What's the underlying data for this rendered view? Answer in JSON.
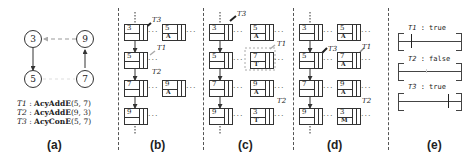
{
  "panels": {
    "a": {
      "label": "(a)",
      "graph": {
        "nodes": [
          "3",
          "9",
          "5",
          "7"
        ],
        "edges": [
          {
            "from": "3",
            "to": "5",
            "style": "solid"
          },
          {
            "from": "7",
            "to": "9",
            "style": "solid"
          },
          {
            "from": "9",
            "to": "3",
            "style": "dashed"
          },
          {
            "from": "5",
            "to": "7",
            "style": "dashed-faint"
          }
        ]
      },
      "legend": [
        {
          "thread": "T1",
          "sep": ":",
          "op": "AcyAddE",
          "args": "(5, 7)"
        },
        {
          "thread": "T2",
          "sep": ":",
          "op": "AcyAddE",
          "args": "(9, 3)"
        },
        {
          "thread": "T3",
          "sep": ":",
          "op": "AcyConE",
          "args": "(5, 7)"
        }
      ]
    },
    "b": {
      "label": "(b)",
      "vertex_list": [
        "3",
        "5",
        "7",
        "9"
      ],
      "edge_cells": [
        {
          "row": 0,
          "key": "5",
          "tag": "A"
        },
        {
          "row": 2,
          "key": "9",
          "tag": "A"
        }
      ],
      "threads": [
        "T3",
        "T1",
        "T2"
      ]
    },
    "c": {
      "label": "(c)",
      "vertex_list": [
        "3",
        "5",
        "7",
        "9"
      ],
      "edge_cells": [
        {
          "row": 0,
          "key": "5",
          "tag": "A"
        },
        {
          "row": 1,
          "key": "7",
          "tag": "T"
        },
        {
          "row": 2,
          "key": "9",
          "tag": "A"
        },
        {
          "row": 3,
          "key": "3",
          "tag": "T"
        }
      ],
      "threads": [
        "T3",
        "T1",
        "T2"
      ]
    },
    "d": {
      "label": "(d)",
      "vertex_list": [
        "3",
        "5",
        "7",
        "9"
      ],
      "edge_cells": [
        {
          "row": 0,
          "key": "5",
          "tag": "A"
        },
        {
          "row": 1,
          "key": "7",
          "tag": "A"
        },
        {
          "row": 2,
          "key": "9",
          "tag": "A"
        },
        {
          "row": 3,
          "key": "3",
          "tag": "M"
        }
      ],
      "threads": [
        "T3",
        "T1",
        "T2"
      ]
    },
    "e": {
      "label": "(e)",
      "intervals": [
        {
          "thread": "T1",
          "result": "true"
        },
        {
          "thread": "T2",
          "result": "false"
        },
        {
          "thread": "T3",
          "result": "true"
        }
      ]
    }
  },
  "ellipsis": "···"
}
